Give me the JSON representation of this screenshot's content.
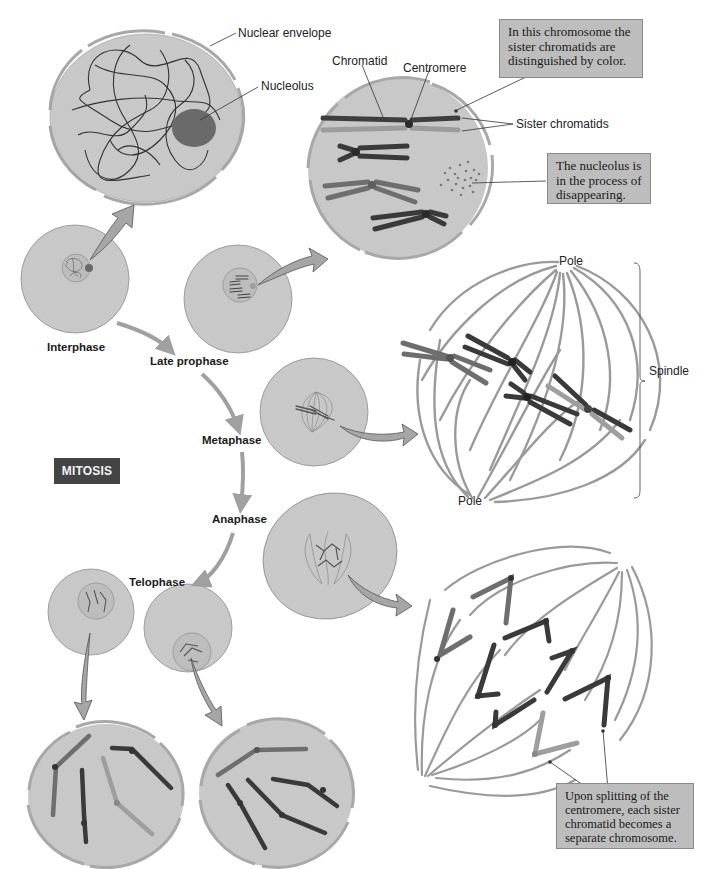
{
  "figure": {
    "title_badge": "MITOSIS",
    "colors": {
      "cell_fill": "#c8c8c8",
      "cell_stroke": "#8e8e8e",
      "nucleus_fill": "#bdbdbd",
      "envelope": "#a8a8a8",
      "chromosome_dark": "#3a3a3a",
      "chromosome_medium": "#6e6e6e",
      "chromosome_light": "#9e9e9e",
      "nucleolus": "#6a6a6a",
      "arrow_fill": "#a6a6a6",
      "spindle": "#9a9a9a",
      "badge_bg": "#444444",
      "note_bg": "#bdbdbd"
    }
  },
  "phases": {
    "interphase": "Interphase",
    "late_prophase": "Late prophase",
    "metaphase": "Metaphase",
    "anaphase": "Anaphase",
    "telophase": "Telophase"
  },
  "labels": {
    "nuclear_envelope": "Nuclear envelope",
    "nucleolus": "Nucleolus",
    "chromatid": "Chromatid",
    "centromere": "Centromere",
    "sister_chromatids": "Sister chromatids",
    "pole_top": "Pole",
    "pole_bottom": "Pole",
    "spindle": "Spindle"
  },
  "notes": {
    "sister_color": [
      "In this chromosome the",
      "sister chromatids are",
      "distinguished by color."
    ],
    "nucleolus_disappearing": [
      "The nucleolus is",
      "in the process of",
      "disappearing."
    ],
    "centromere_split": [
      "Upon splitting of the",
      "centromere, each sister",
      "chromatid becomes a",
      "separate chromosome."
    ]
  }
}
